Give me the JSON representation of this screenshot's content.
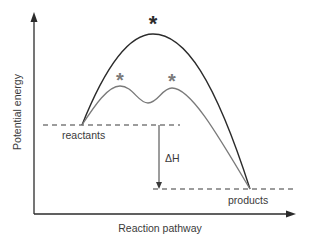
{
  "diagram": {
    "type": "energy-profile",
    "axes": {
      "y_label": "Potential energy",
      "x_label": "Reaction pathway"
    },
    "levels": {
      "reactants_label": "reactants",
      "products_label": "products"
    },
    "delta_label": "ΔH",
    "markers": {
      "transition_state_symbol": "*"
    },
    "curves": [
      {
        "name": "uncatalysed",
        "color": "#2b2b2b",
        "peaks": 1
      },
      {
        "name": "catalysed",
        "color": "#7a7a7a",
        "peaks": 2
      }
    ],
    "colors": {
      "axis": "#2b2b2b",
      "dark_curve": "#2b2b2b",
      "light_curve": "#7a7a7a",
      "dashed": "#3a3a3a",
      "text": "#3a3a3a"
    }
  }
}
